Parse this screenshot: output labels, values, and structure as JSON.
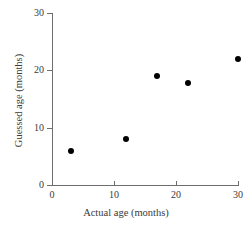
{
  "chart_data": {
    "type": "scatter",
    "title": "",
    "xlabel": "Actual age (months)",
    "ylabel": "Guessed age (months)",
    "xlim": [
      0,
      30
    ],
    "ylim": [
      0,
      30
    ],
    "xticks": [
      0,
      10,
      20,
      30
    ],
    "yticks": [
      0,
      10,
      20,
      30
    ],
    "xtick_labels": [
      "0",
      "10",
      "20",
      "30"
    ],
    "ytick_labels": [
      "0",
      "10",
      "20",
      "30"
    ],
    "grid": false,
    "legend": null,
    "marker_color": "#000000",
    "axis_color": "#6e6e6e",
    "points": [
      {
        "x": 3,
        "y": 6
      },
      {
        "x": 12,
        "y": 8
      },
      {
        "x": 17,
        "y": 19
      },
      {
        "x": 22,
        "y": 17.8
      },
      {
        "x": 30,
        "y": 22
      }
    ]
  }
}
